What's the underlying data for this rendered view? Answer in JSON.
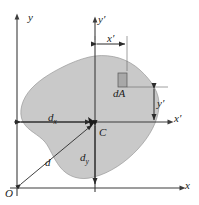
{
  "figure": {
    "type": "engineering-diagram",
    "background_color": "#ffffff",
    "area_fill_color": "#c9c9c9",
    "area_stroke_color": "#9a9a9a",
    "axis_color": "#3c3c3c",
    "dimension_color": "#2b2b2b",
    "label_color": "#1a1a1a"
  },
  "axes": {
    "y_label": "y",
    "x_label": "x",
    "y_prime_label": "y",
    "y_prime_mark": "′",
    "x_prime_label": "x",
    "x_prime_mark": "′",
    "origin_label": "O"
  },
  "points": {
    "centroid_label": "C"
  },
  "element": {
    "area_element_label": "dA"
  },
  "dimensions": {
    "x_prime": {
      "base": "x",
      "mark": "′"
    },
    "y_prime": {
      "base": "y",
      "mark": "′"
    },
    "d_x": {
      "base": "d",
      "sub": "x"
    },
    "d_y": {
      "base": "d",
      "sub": "y"
    },
    "d": {
      "base": "d"
    }
  },
  "geometry": {
    "origin": {
      "x": 17,
      "y": 188
    },
    "centroid": {
      "x": 95,
      "y": 122
    },
    "area_element": {
      "x": 122,
      "y": 80,
      "w": 9,
      "h": 13
    },
    "y_axis_x": 17,
    "x_axis_y": 188,
    "y_prime_axis_x": 95,
    "x_prime_axis_y": 122
  }
}
